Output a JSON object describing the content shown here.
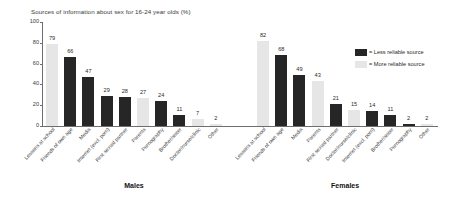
{
  "chart_data": {
    "type": "bar",
    "title": "Sources of information about sex for 16-24 year olds (%)",
    "xlabel": "",
    "ylabel": "",
    "ylim": [
      0,
      100
    ],
    "yticks": [
      "0",
      "20",
      "40",
      "60",
      "80",
      "100"
    ],
    "grid": false,
    "legend_position": "right",
    "legend": [
      {
        "key": "less",
        "label": "= Less reliable source",
        "color": "#262626"
      },
      {
        "key": "more",
        "label": "= More reliable source",
        "color": "#e6e6e6"
      }
    ],
    "panels": [
      {
        "name": "Males",
        "categories": [
          "Lessons at school",
          "Friends of own age",
          "Media",
          "Internet (excl. porn)",
          "First sexual partner",
          "Parents",
          "Pornography",
          "Brother/sister",
          "Doctor/nurse/clinic",
          "Other"
        ],
        "values": [
          79,
          66,
          47,
          29,
          28,
          27,
          24,
          11,
          7,
          2
        ],
        "reliability": [
          "more",
          "less",
          "less",
          "less",
          "less",
          "more",
          "less",
          "less",
          "more",
          "more"
        ]
      },
      {
        "name": "Females",
        "categories": [
          "Lessons at school",
          "Friends of own age",
          "Media",
          "Parents",
          "First sexual partner",
          "Doctor/nurse/clinic",
          "Internet (excl. porn)",
          "Brother/sister",
          "Pornography",
          "Other"
        ],
        "values": [
          82,
          68,
          49,
          43,
          21,
          15,
          14,
          11,
          2,
          2
        ],
        "reliability": [
          "more",
          "less",
          "less",
          "more",
          "less",
          "more",
          "less",
          "less",
          "less",
          "more"
        ]
      }
    ]
  }
}
